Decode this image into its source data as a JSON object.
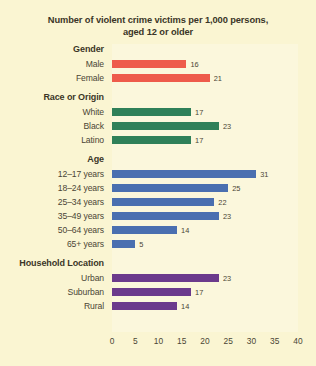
{
  "chart_data": {
    "type": "bar",
    "orientation": "horizontal",
    "title": "Number of violent crime victims per 1,000 persons, aged 12 or older",
    "title_line1": "Number of violent crime victims per 1,000 persons,",
    "title_line2": "aged 12 or older",
    "xlabel": "",
    "ylabel": "",
    "xlim": [
      0,
      40
    ],
    "xticks": [
      "0",
      "5",
      "10",
      "15",
      "20",
      "25",
      "30",
      "35",
      "40"
    ],
    "grid": false,
    "legend": "none",
    "background_color": "#faf5d2",
    "groups": [
      {
        "name": "Gender",
        "color": "#ee5b4b",
        "categories": [
          "Male",
          "Female"
        ],
        "values": [
          16,
          21
        ]
      },
      {
        "name": "Race or Origin",
        "color": "#2f8059",
        "categories": [
          "White",
          "Black",
          "Latino"
        ],
        "values": [
          17,
          23,
          17
        ]
      },
      {
        "name": "Age",
        "color": "#4a6fb0",
        "categories": [
          "12–17 years",
          "18–24 years",
          "25–34 years",
          "35–49 years",
          "50–64 years",
          "65+ years"
        ],
        "values": [
          31,
          25,
          22,
          23,
          14,
          5
        ]
      },
      {
        "name": "Household Location",
        "color": "#6b3a8c",
        "categories": [
          "Urban",
          "Suburban",
          "Rural"
        ],
        "values": [
          23,
          17,
          14
        ]
      }
    ]
  }
}
